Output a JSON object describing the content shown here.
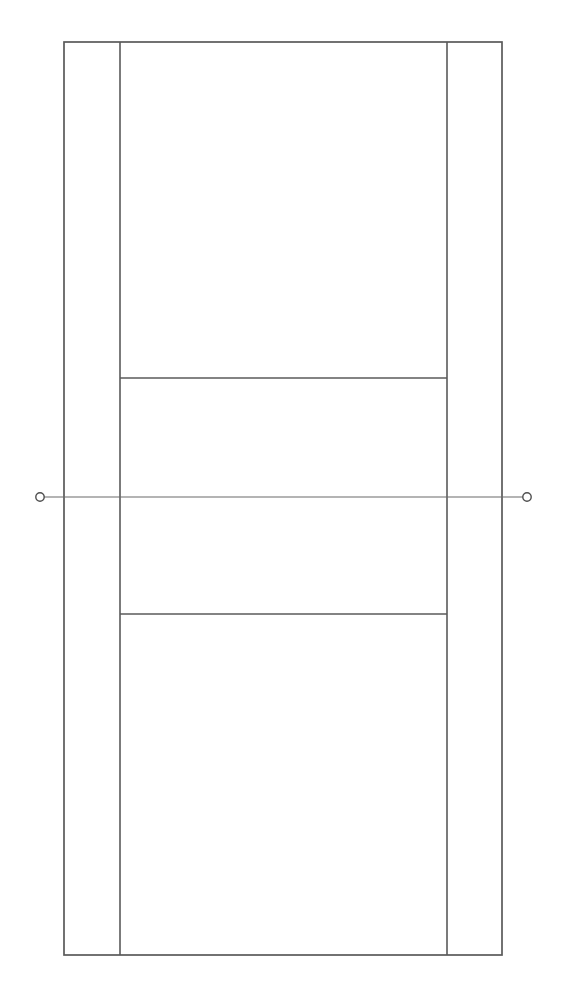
{
  "canvas": {
    "width": 564,
    "height": 1000,
    "background_color": "#ffffff"
  },
  "diagram": {
    "type": "line-drawing",
    "orientation": "vertical",
    "line_color": "#5a5a5a",
    "net_line_color": "#6a6a6a",
    "net_post_stroke_color": "#4f4f4f",
    "court_fill_color": "#ffffff",
    "court_line_width": 1.6,
    "net_line_width": 1.2
  },
  "geometry": {
    "court_outline": {
      "name": "doubles-court-boundary",
      "x": 64,
      "y": 42,
      "width": 438,
      "height": 913,
      "right": 502,
      "bottom": 955
    },
    "singles_sideline_left": {
      "name": "left-singles-sideline",
      "x": 120,
      "y1": 42,
      "y2": 955
    },
    "singles_sideline_right": {
      "name": "right-singles-sideline",
      "x": 447,
      "y1": 42,
      "y2": 955
    },
    "service_line_top": {
      "name": "top-service-line",
      "y": 378,
      "x1": 120,
      "x2": 447
    },
    "service_line_bottom": {
      "name": "bottom-service-line",
      "y": 614,
      "x1": 120,
      "x2": 447
    },
    "net_line": {
      "name": "net-line",
      "y": 497,
      "x1": 40,
      "x2": 527
    },
    "net_post_left": {
      "name": "left-net-post",
      "cx": 40,
      "cy": 497,
      "r": 4.2
    },
    "net_post_right": {
      "name": "right-net-post",
      "cx": 527,
      "cy": 497,
      "r": 4.2
    }
  },
  "regions": [
    {
      "name": "top-doubles-alley-left",
      "label": ""
    },
    {
      "name": "top-doubles-alley-right",
      "label": ""
    },
    {
      "name": "top-backcourt",
      "label": ""
    },
    {
      "name": "top-service-area",
      "label": ""
    },
    {
      "name": "bottom-service-area",
      "label": ""
    },
    {
      "name": "bottom-backcourt",
      "label": ""
    }
  ],
  "labels": {
    "none_visible": ""
  }
}
